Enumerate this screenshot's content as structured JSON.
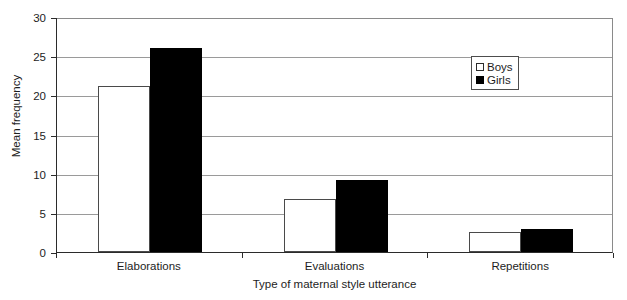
{
  "chart_data": {
    "type": "bar",
    "title": "",
    "subtitle": "",
    "xlabel": "Type of maternal style utterance",
    "ylabel": "Mean frequency",
    "categories": [
      "Elaborations",
      "Evaluations",
      "Repetitions"
    ],
    "series": [
      {
        "name": "Boys",
        "values": [
          21.2,
          6.8,
          2.6
        ],
        "color": "#ffffff",
        "edge_color": "#4a4a4a"
      },
      {
        "name": "Girls",
        "values": [
          26.0,
          9.2,
          3.0
        ],
        "color": "#000000",
        "edge_color": "#000000"
      }
    ],
    "ylim": [
      0,
      30
    ],
    "ytick_step": 5,
    "yticks": [
      0,
      5,
      10,
      15,
      20,
      25,
      30
    ],
    "ytick_labels": [
      "0",
      "5",
      "10",
      "15",
      "20",
      "25",
      "30"
    ],
    "grid": true,
    "grid_axis": "y",
    "legend_position": "upper right",
    "legend_entries": [
      "Boys",
      "Girls"
    ]
  }
}
